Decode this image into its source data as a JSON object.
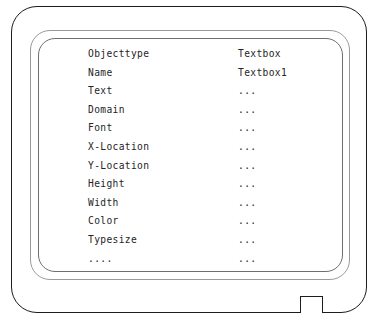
{
  "diagram": {
    "device": {
      "type": "screen-bezel",
      "frames": 3,
      "stand_tab": "bottom-right-tab"
    },
    "colors": {
      "outline": "#1c1c1c",
      "inner_outline_mid": "#9a9a9a",
      "inner_outline": "#6e6e6e",
      "text": "#242424",
      "background": "#ffffff"
    }
  },
  "property_table": {
    "columns": [
      "property",
      "value"
    ],
    "rows": [
      {
        "property": "Objecttype",
        "value": "Textbox"
      },
      {
        "property": "Name",
        "value": "Textbox1"
      },
      {
        "property": "Text",
        "value": "..."
      },
      {
        "property": "Domain",
        "value": "..."
      },
      {
        "property": "Font",
        "value": "..."
      },
      {
        "property": "X-Location",
        "value": "..."
      },
      {
        "property": "Y-Location",
        "value": "..."
      },
      {
        "property": "Height",
        "value": "..."
      },
      {
        "property": "Width",
        "value": "..."
      },
      {
        "property": "Color",
        "value": "..."
      },
      {
        "property": "Typesize",
        "value": "..."
      },
      {
        "property": "....",
        "value": "..."
      }
    ]
  }
}
